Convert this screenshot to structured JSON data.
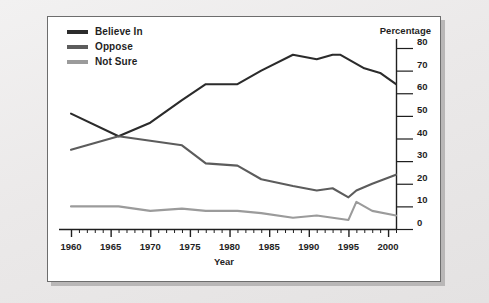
{
  "figure": {
    "panel_bg": "#ffffff",
    "page_bg": "#eceaea",
    "border_color": "#6d6d6d"
  },
  "legend": {
    "position": "top-left",
    "items": [
      {
        "label": "Believe In",
        "color": "#2b2b2b",
        "icon": "line-swatch-icon"
      },
      {
        "label": "Oppose",
        "color": "#5c5c5c",
        "icon": "line-swatch-icon"
      },
      {
        "label": "Not Sure",
        "color": "#9b9b9b",
        "icon": "line-swatch-icon"
      }
    ]
  },
  "axes": {
    "y_title": "Percentage",
    "x_title": "Year",
    "y_ticks": [
      "0",
      "10",
      "20",
      "30",
      "40",
      "50",
      "60",
      "70",
      "80"
    ],
    "x_ticks": [
      "1960",
      "1965",
      "1970",
      "1975",
      "1980",
      "1985",
      "1990",
      "1995",
      "2000"
    ]
  },
  "chart_data": {
    "type": "line",
    "title": "",
    "subtitle": "",
    "xlabel": "Year",
    "ylabel": "Percentage",
    "xlim": [
      1960,
      2001
    ],
    "ylim": [
      0,
      80
    ],
    "grid": false,
    "legend_position": "top-left",
    "y_tick_values": [
      0,
      10,
      20,
      30,
      40,
      50,
      60,
      70,
      80
    ],
    "x_tick_values": [
      1960,
      1965,
      1970,
      1975,
      1980,
      1985,
      1990,
      1995,
      2000
    ],
    "x_minor_tick_interval": 1,
    "series": [
      {
        "name": "Believe In",
        "color": "#2b2b2b",
        "x": [
          1960,
          1966,
          1970,
          1974,
          1977,
          1981,
          1984,
          1988,
          1991,
          1993,
          1994,
          1997,
          1999,
          2001
        ],
        "values": [
          51,
          41,
          47,
          57,
          64,
          64,
          70,
          77,
          75,
          77,
          77,
          71,
          69,
          64
        ]
      },
      {
        "name": "Oppose",
        "color": "#5c5c5c",
        "x": [
          1960,
          1966,
          1970,
          1974,
          1977,
          1981,
          1984,
          1988,
          1991,
          1993,
          1995,
          1996,
          1998,
          2001
        ],
        "values": [
          35,
          41,
          39,
          37,
          29,
          28,
          22,
          19,
          17,
          18,
          14,
          17,
          20,
          24
        ]
      },
      {
        "name": "Not Sure",
        "color": "#9b9b9b",
        "x": [
          1960,
          1966,
          1970,
          1974,
          1977,
          1981,
          1984,
          1988,
          1991,
          1993,
          1995,
          1996,
          1998,
          2001
        ],
        "values": [
          10,
          10,
          8,
          9,
          8,
          8,
          7,
          5,
          6,
          5,
          4,
          12,
          8,
          6
        ]
      }
    ]
  }
}
